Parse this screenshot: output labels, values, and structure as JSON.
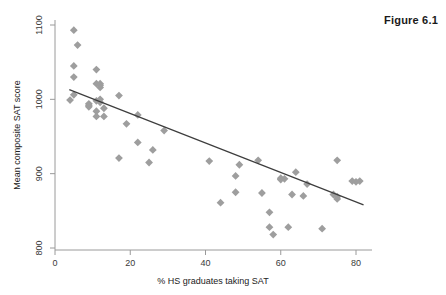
{
  "figure": {
    "label": "Figure 6.1"
  },
  "chart_data": {
    "type": "scatter",
    "title": "Figure 6.1",
    "xlabel": "% HS graduates taking SAT",
    "ylabel": "Mean composite SAT score",
    "xlim": [
      0,
      85
    ],
    "ylim": [
      790,
      1110
    ],
    "xticks": [
      0,
      20,
      40,
      60,
      80
    ],
    "yticks": [
      800,
      900,
      1000,
      1100
    ],
    "xtick_labels": [
      "0",
      "20",
      "40",
      "60",
      "80"
    ],
    "ytick_labels": [
      "800",
      "900",
      "1000",
      "1100"
    ],
    "grid": false,
    "legend": "none",
    "marker": {
      "shape": "diamond",
      "color": "#9e9e9e",
      "size": 5
    },
    "points": [
      {
        "x": 5,
        "y": 1093
      },
      {
        "x": 6,
        "y": 1073
      },
      {
        "x": 5,
        "y": 1045
      },
      {
        "x": 11,
        "y": 1040
      },
      {
        "x": 5,
        "y": 1030
      },
      {
        "x": 11,
        "y": 1021
      },
      {
        "x": 12,
        "y": 1021
      },
      {
        "x": 12,
        "y": 1019
      },
      {
        "x": 12,
        "y": 1016
      },
      {
        "x": 5,
        "y": 1006
      },
      {
        "x": 17,
        "y": 1005
      },
      {
        "x": 4,
        "y": 999
      },
      {
        "x": 12,
        "y": 1000
      },
      {
        "x": 11,
        "y": 998
      },
      {
        "x": 12,
        "y": 996
      },
      {
        "x": 9,
        "y": 994
      },
      {
        "x": 9,
        "y": 992
      },
      {
        "x": 9,
        "y": 990
      },
      {
        "x": 13,
        "y": 988
      },
      {
        "x": 11,
        "y": 984
      },
      {
        "x": 22,
        "y": 979
      },
      {
        "x": 11,
        "y": 977
      },
      {
        "x": 13,
        "y": 977
      },
      {
        "x": 19,
        "y": 967
      },
      {
        "x": 22,
        "y": 942
      },
      {
        "x": 26,
        "y": 932
      },
      {
        "x": 29,
        "y": 958
      },
      {
        "x": 17,
        "y": 921
      },
      {
        "x": 25,
        "y": 915
      },
      {
        "x": 41,
        "y": 917
      },
      {
        "x": 54,
        "y": 918
      },
      {
        "x": 75,
        "y": 918
      },
      {
        "x": 49,
        "y": 912
      },
      {
        "x": 64,
        "y": 902
      },
      {
        "x": 48,
        "y": 897
      },
      {
        "x": 60,
        "y": 894
      },
      {
        "x": 61,
        "y": 893
      },
      {
        "x": 60,
        "y": 892
      },
      {
        "x": 79,
        "y": 890
      },
      {
        "x": 81,
        "y": 890
      },
      {
        "x": 80,
        "y": 889
      },
      {
        "x": 67,
        "y": 886
      },
      {
        "x": 48,
        "y": 875
      },
      {
        "x": 55,
        "y": 874
      },
      {
        "x": 63,
        "y": 872
      },
      {
        "x": 66,
        "y": 870
      },
      {
        "x": 74,
        "y": 872
      },
      {
        "x": 75,
        "y": 869
      },
      {
        "x": 75,
        "y": 866
      },
      {
        "x": 44,
        "y": 861
      },
      {
        "x": 57,
        "y": 848
      },
      {
        "x": 57,
        "y": 828
      },
      {
        "x": 62,
        "y": 828
      },
      {
        "x": 71,
        "y": 826
      },
      {
        "x": 58,
        "y": 818
      }
    ],
    "fit_line": {
      "label": "linear fit",
      "x_start": 3.8,
      "y_start": 1013,
      "x_end": 82.0,
      "y_end": 858,
      "color": "#3d3d3d"
    }
  }
}
